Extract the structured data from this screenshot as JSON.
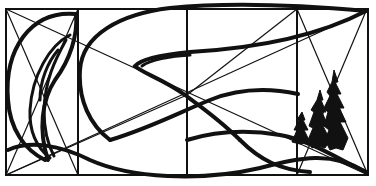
{
  "diagram": {
    "title": "",
    "colors": {
      "ink": "#111111",
      "paper": "#ffffff"
    },
    "frame": {
      "x": 6,
      "y": 9,
      "width": 362,
      "height": 166
    },
    "grid_columns_x": [
      78,
      187,
      297
    ],
    "elements": [
      "outer-frame",
      "column-dividers",
      "construction-diagonals",
      "left-leaf-shape",
      "large-arc",
      "middle-wave",
      "lower-sweep",
      "tree-cluster"
    ]
  }
}
